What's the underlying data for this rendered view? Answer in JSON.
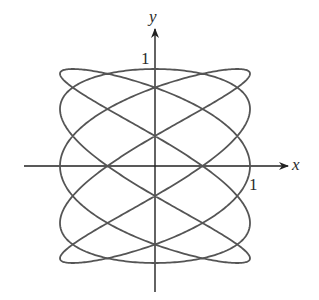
{
  "chart_data": {
    "type": "line",
    "title": "",
    "subtitle": "",
    "xlabel": "x",
    "ylabel": "y",
    "parametric": {
      "x": "sin(5t)",
      "y": "cos(3t)",
      "t_range": [
        0,
        6.283185307179586
      ]
    },
    "x_ticks": [
      {
        "value": 1,
        "label": "1"
      }
    ],
    "y_ticks": [
      {
        "value": 1,
        "label": "1"
      }
    ],
    "xlim": [
      -1.37,
      1.38
    ],
    "ylim": [
      -1.3,
      1.4
    ],
    "grid": false,
    "legend": null,
    "series": [
      {
        "name": "curve",
        "color": "#555555"
      }
    ],
    "axes_color": "#222222"
  },
  "labels": {
    "x_axis": "x",
    "y_axis": "y",
    "x_tick_one": "1",
    "y_tick_one": "1"
  }
}
